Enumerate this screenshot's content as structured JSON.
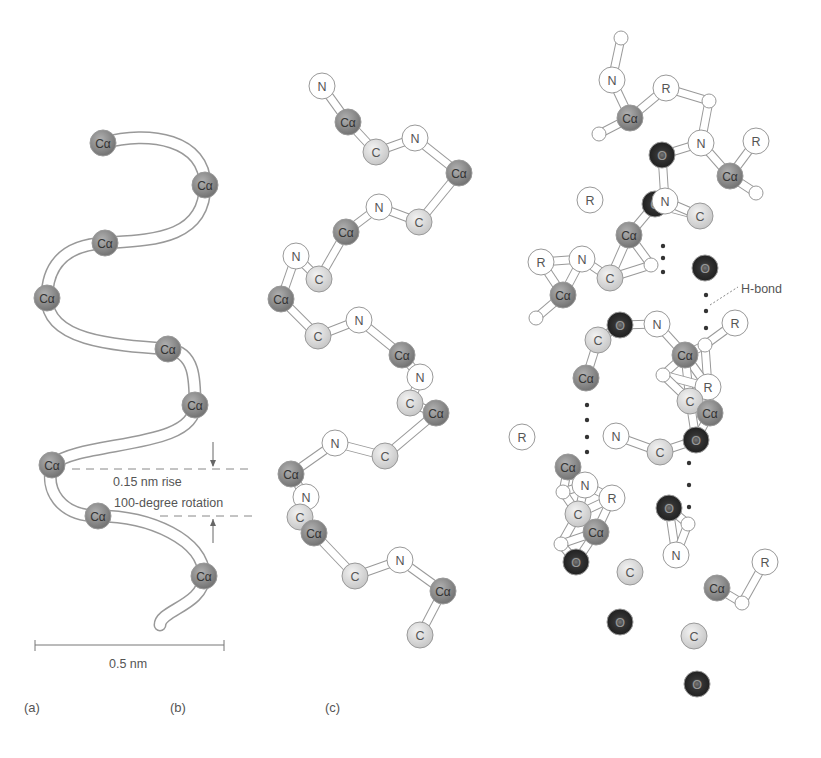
{
  "figure": {
    "panels": [
      {
        "id": "a",
        "label": "(a)",
        "x": 24,
        "y": 710
      },
      {
        "id": "b",
        "label": "(b)",
        "x": 170,
        "y": 710
      },
      {
        "id": "c",
        "label": "(c)",
        "x": 325,
        "y": 710
      }
    ],
    "panel_a": {
      "atom_label": "Cα",
      "atoms": [
        [
          103,
          143
        ],
        [
          205,
          185
        ],
        [
          105,
          243
        ],
        [
          47,
          298
        ],
        [
          168,
          349
        ],
        [
          195,
          405
        ],
        [
          52,
          465
        ],
        [
          98,
          516
        ],
        [
          204,
          576
        ]
      ],
      "rise_label": "0.15 nm rise",
      "rotation_label": "100-degree rotation",
      "scale_label": "0.5 nm"
    },
    "panel_b": {
      "atoms": [
        {
          "t": "N",
          "x": 322,
          "y": 86
        },
        {
          "t": "Cα",
          "x": 348,
          "y": 122
        },
        {
          "t": "C",
          "x": 376,
          "y": 152
        },
        {
          "t": "N",
          "x": 415,
          "y": 138
        },
        {
          "t": "Cα",
          "x": 459,
          "y": 173
        },
        {
          "t": "N",
          "x": 379,
          "y": 207
        },
        {
          "t": "C",
          "x": 419,
          "y": 222
        },
        {
          "t": "Cα",
          "x": 346,
          "y": 232
        },
        {
          "t": "N",
          "x": 296,
          "y": 256
        },
        {
          "t": "C",
          "x": 319,
          "y": 279
        },
        {
          "t": "Cα",
          "x": 281,
          "y": 299
        },
        {
          "t": "C",
          "x": 318,
          "y": 336
        },
        {
          "t": "N",
          "x": 359,
          "y": 320
        },
        {
          "t": "Cα",
          "x": 402,
          "y": 355
        },
        {
          "t": "N",
          "x": 420,
          "y": 377
        },
        {
          "t": "C",
          "x": 410,
          "y": 403
        },
        {
          "t": "Cα",
          "x": 436,
          "y": 413
        },
        {
          "t": "N",
          "x": 335,
          "y": 443
        },
        {
          "t": "C",
          "x": 385,
          "y": 456
        },
        {
          "t": "Cα",
          "x": 291,
          "y": 474
        },
        {
          "t": "N",
          "x": 306,
          "y": 497
        },
        {
          "t": "C",
          "x": 300,
          "y": 517
        },
        {
          "t": "Cα",
          "x": 314,
          "y": 533
        },
        {
          "t": "C",
          "x": 355,
          "y": 576
        },
        {
          "t": "N",
          "x": 400,
          "y": 560
        },
        {
          "t": "Cα",
          "x": 443,
          "y": 591
        },
        {
          "t": "C",
          "x": 420,
          "y": 635
        }
      ]
    },
    "panel_c": {
      "hbond_label": "H-bond",
      "atoms": [
        {
          "t": "H",
          "x": 621,
          "y": 38
        },
        {
          "t": "N",
          "x": 612,
          "y": 80
        },
        {
          "t": "R",
          "x": 666,
          "y": 88
        },
        {
          "t": "Cα",
          "x": 630,
          "y": 118
        },
        {
          "t": "H",
          "x": 599,
          "y": 134
        },
        {
          "t": "O",
          "x": 662,
          "y": 155
        },
        {
          "t": "N",
          "x": 701,
          "y": 143
        },
        {
          "t": "H",
          "x": 709,
          "y": 101
        },
        {
          "t": "R",
          "x": 756,
          "y": 141
        },
        {
          "t": "Cα",
          "x": 730,
          "y": 176
        },
        {
          "t": "H",
          "x": 756,
          "y": 193
        },
        {
          "t": "O",
          "x": 655,
          "y": 204
        },
        {
          "t": "N",
          "x": 665,
          "y": 201
        },
        {
          "t": "C",
          "x": 700,
          "y": 216
        },
        {
          "t": "R",
          "x": 590,
          "y": 200
        },
        {
          "t": "Cα",
          "x": 629,
          "y": 235
        },
        {
          "t": "H",
          "x": 651,
          "y": 265
        },
        {
          "t": "N",
          "x": 582,
          "y": 259
        },
        {
          "t": "C",
          "x": 610,
          "y": 278
        },
        {
          "t": "O",
          "x": 705,
          "y": 268
        },
        {
          "t": "R",
          "x": 541,
          "y": 262
        },
        {
          "t": "Cα",
          "x": 563,
          "y": 295
        },
        {
          "t": "H",
          "x": 536,
          "y": 318
        },
        {
          "t": "O",
          "x": 620,
          "y": 325
        },
        {
          "t": "N",
          "x": 657,
          "y": 324
        },
        {
          "t": "C",
          "x": 598,
          "y": 340
        },
        {
          "t": "R",
          "x": 735,
          "y": 323
        },
        {
          "t": "H",
          "x": 705,
          "y": 345
        },
        {
          "t": "Cα",
          "x": 685,
          "y": 355
        },
        {
          "t": "H",
          "x": 663,
          "y": 375
        },
        {
          "t": "Cα",
          "x": 586,
          "y": 378
        },
        {
          "t": "R",
          "x": 708,
          "y": 387
        },
        {
          "t": "C",
          "x": 690,
          "y": 401
        },
        {
          "t": "Cα",
          "x": 710,
          "y": 413
        },
        {
          "t": "O",
          "x": 696,
          "y": 440
        },
        {
          "t": "R",
          "x": 522,
          "y": 437
        },
        {
          "t": "N",
          "x": 616,
          "y": 436
        },
        {
          "t": "C",
          "x": 660,
          "y": 452
        },
        {
          "t": "Cα",
          "x": 568,
          "y": 467
        },
        {
          "t": "N",
          "x": 585,
          "y": 485
        },
        {
          "t": "R",
          "x": 612,
          "y": 498
        },
        {
          "t": "H",
          "x": 563,
          "y": 492
        },
        {
          "t": "C",
          "x": 578,
          "y": 514
        },
        {
          "t": "Cα",
          "x": 596,
          "y": 532
        },
        {
          "t": "O",
          "x": 669,
          "y": 508
        },
        {
          "t": "H",
          "x": 561,
          "y": 544
        },
        {
          "t": "O",
          "x": 576,
          "y": 562
        },
        {
          "t": "H",
          "x": 688,
          "y": 524
        },
        {
          "t": "N",
          "x": 676,
          "y": 555
        },
        {
          "t": "C",
          "x": 630,
          "y": 572
        },
        {
          "t": "R",
          "x": 765,
          "y": 562
        },
        {
          "t": "Cα",
          "x": 717,
          "y": 588
        },
        {
          "t": "H",
          "x": 742,
          "y": 603
        },
        {
          "t": "O",
          "x": 620,
          "y": 622
        },
        {
          "t": "C",
          "x": 694,
          "y": 636
        },
        {
          "t": "O",
          "x": 697,
          "y": 684
        }
      ]
    },
    "colors": {
      "calpha": "#8a8a8a",
      "carbon": "#d9d9d9",
      "nitrogen": "#ffffff",
      "oxygen": "#2a2a2a",
      "hydrogen": "#ffffff",
      "rgroup": "#ffffff",
      "stroke": "#999999",
      "text": "#555555"
    }
  }
}
